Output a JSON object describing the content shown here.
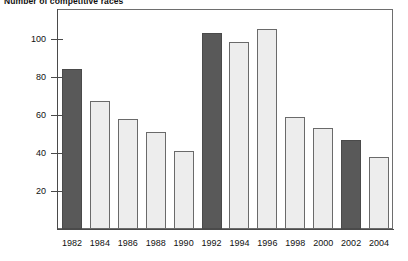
{
  "chart_data": {
    "type": "bar",
    "title": "Number of competitive races",
    "xlabel": "",
    "ylabel": "",
    "categories": [
      "1982",
      "1984",
      "1986",
      "1988",
      "1990",
      "1992",
      "1994",
      "1996",
      "1998",
      "2000",
      "2002",
      "2004"
    ],
    "values": [
      84,
      67,
      58,
      51,
      41,
      103,
      98,
      105,
      59,
      53,
      47,
      38
    ],
    "bar_styles": [
      "dark",
      "light",
      "light",
      "light",
      "light",
      "dark",
      "light",
      "light",
      "light",
      "light",
      "dark",
      "light"
    ],
    "ylim": [
      0,
      115
    ],
    "yticks": [
      20,
      40,
      60,
      80,
      100
    ],
    "ytick_labels": [
      "20",
      "40",
      "60",
      "80",
      "100"
    ],
    "grid": false,
    "legend": null,
    "colors": {
      "dark_bar": "#595959",
      "light_bar": "#ededed",
      "bar_outline": "#5b5b5b",
      "axis": "#4a4a4a",
      "frame": "#6e6e6e",
      "text": "#111111",
      "background": "#ffffff"
    }
  }
}
